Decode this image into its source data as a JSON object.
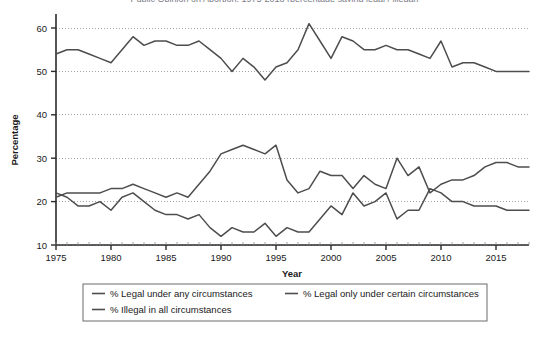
{
  "figure": {
    "cut_off_title": "Public Opinion on Abortion, 1975-2018 (percentage saying legal / illegal)",
    "line_color": "#4d4d4d",
    "grid_color": "#9a9a9a",
    "axis_color": "#2b2b2b",
    "background": "#ffffff"
  },
  "axes": {
    "ylabel": "Percentage",
    "xlabel": "Year",
    "xticks": [
      1975,
      1980,
      1985,
      1990,
      1995,
      2000,
      2005,
      2010,
      2015
    ],
    "yticks": [
      10,
      20,
      30,
      40,
      50,
      60
    ],
    "xlim": [
      1975,
      2018
    ],
    "ylim": [
      10,
      63
    ],
    "grid": "horizontal-dotted"
  },
  "legend": {
    "position": "below-axes",
    "border": true,
    "entries": [
      {
        "label": "% Legal under any circumstances",
        "color": "#4d4d4d"
      },
      {
        "label": "% Legal only under certain circumstances",
        "color": "#4d4d4d"
      },
      {
        "label": "% Illegal in all circumstances",
        "color": "#4d4d4d"
      }
    ]
  },
  "chart_data": {
    "type": "line",
    "title": "Public Opinion on Abortion, 1975-2018 (percentage saying legal / illegal)",
    "xlabel": "Year",
    "ylabel": "Percentage",
    "xlim": [
      1975,
      2018
    ],
    "ylim": [
      10,
      63
    ],
    "grid": true,
    "legend_position": "bottom",
    "x": [
      1975,
      1976,
      1977,
      1978,
      1979,
      1980,
      1981,
      1982,
      1983,
      1984,
      1985,
      1986,
      1987,
      1988,
      1989,
      1990,
      1991,
      1992,
      1993,
      1994,
      1995,
      1996,
      1997,
      1998,
      1999,
      2000,
      2001,
      2002,
      2003,
      2004,
      2005,
      2006,
      2007,
      2008,
      2009,
      2010,
      2011,
      2012,
      2013,
      2014,
      2015,
      2016,
      2017,
      2018
    ],
    "series": [
      {
        "name": "% Legal only under certain circumstances",
        "values": [
          54,
          55,
          55,
          54,
          53,
          52,
          55,
          58,
          56,
          57,
          57,
          56,
          56,
          57,
          55,
          53,
          50,
          53,
          51,
          48,
          51,
          52,
          55,
          61,
          57,
          53,
          58,
          57,
          55,
          55,
          56,
          55,
          55,
          54,
          53,
          57,
          51,
          52,
          52,
          51,
          50,
          50,
          50,
          50
        ]
      },
      {
        "name": "% Legal under any circumstances",
        "values": [
          21,
          22,
          22,
          22,
          22,
          23,
          23,
          24,
          23,
          22,
          21,
          22,
          21,
          24,
          27,
          31,
          32,
          33,
          32,
          31,
          33,
          25,
          22,
          23,
          27,
          26,
          26,
          23,
          26,
          24,
          23,
          30,
          26,
          28,
          22,
          24,
          25,
          25,
          26,
          28,
          29,
          29,
          28,
          28
        ]
      },
      {
        "name": "% Illegal in all circumstances",
        "values": [
          22,
          21,
          19,
          19,
          20,
          18,
          21,
          22,
          20,
          18,
          17,
          17,
          16,
          17,
          14,
          12,
          14,
          13,
          13,
          15,
          12,
          14,
          13,
          13,
          16,
          19,
          17,
          22,
          19,
          20,
          22,
          16,
          18,
          18,
          23,
          22,
          20,
          20,
          19,
          19,
          19,
          18,
          18,
          18
        ]
      }
    ]
  }
}
